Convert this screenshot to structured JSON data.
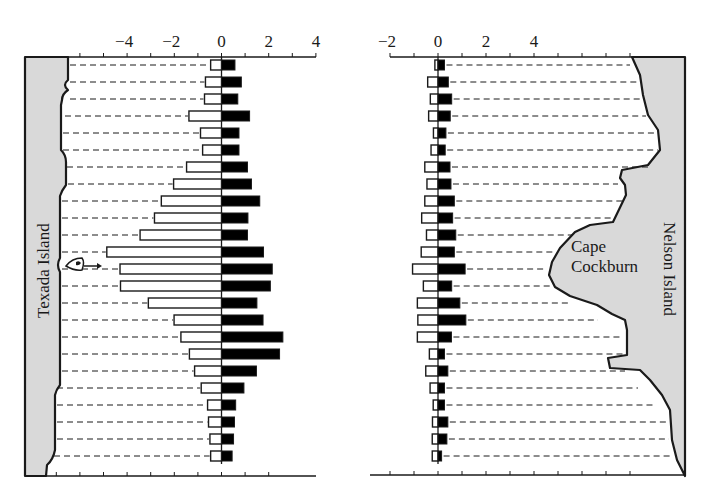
{
  "chart_data": [
    {
      "type": "bar",
      "orientation": "horizontal-diverging",
      "panel": "left",
      "title": "",
      "xlabel": "",
      "ylabel": "",
      "xlim": [
        -4.5,
        4
      ],
      "x_ticks": [
        -4,
        -2,
        0,
        2,
        4
      ],
      "x_tick_labels": [
        "−4",
        "−2",
        "0",
        "2",
        "4"
      ],
      "minor_tick_step": 1,
      "grid": "dashed transect lines from coast to bars",
      "island_label": "Texada Island",
      "marker_annotation": "boat-with-arrow",
      "marker_row": 13,
      "categories": [
        "1",
        "2",
        "3",
        "4",
        "5",
        "6",
        "7",
        "8",
        "9",
        "10",
        "11",
        "12",
        "13",
        "14",
        "15",
        "16",
        "17",
        "18",
        "19",
        "20",
        "21",
        "22",
        "23",
        "24"
      ],
      "series": [
        {
          "name": "open bars (negative)",
          "fill": "#ffffff",
          "values": [
            -0.46,
            -0.68,
            -0.72,
            -1.38,
            -0.89,
            -0.8,
            -1.48,
            -2.03,
            -2.55,
            -2.84,
            -3.45,
            -4.86,
            -4.3,
            -4.28,
            -3.1,
            -2.01,
            -1.72,
            -1.36,
            -1.14,
            -0.86,
            -0.59,
            -0.55,
            -0.49,
            -0.46
          ]
        },
        {
          "name": "filled bars (positive)",
          "fill": "#000000",
          "values": [
            0.57,
            0.84,
            0.69,
            1.19,
            0.74,
            0.74,
            1.1,
            1.27,
            1.62,
            1.12,
            1.1,
            1.78,
            2.15,
            2.07,
            1.5,
            1.76,
            2.6,
            2.46,
            1.48,
            0.95,
            0.6,
            0.55,
            0.51,
            0.45
          ]
        }
      ]
    },
    {
      "type": "bar",
      "orientation": "horizontal-diverging",
      "panel": "right",
      "title": "",
      "xlabel": "",
      "ylabel": "",
      "xlim": [
        -2,
        8
      ],
      "x_ticks": [
        -2,
        0,
        2,
        4
      ],
      "x_tick_labels": [
        "−2",
        "0",
        "2",
        "4"
      ],
      "minor_tick_step": 1,
      "grid": "dashed transect lines from bars to coast",
      "island_label": "Nelson Island",
      "feature_label": "Cape Cockburn",
      "categories": [
        "1",
        "2",
        "3",
        "4",
        "5",
        "6",
        "7",
        "8",
        "9",
        "10",
        "11",
        "12",
        "13",
        "14",
        "15",
        "16",
        "17",
        "18",
        "19",
        "20",
        "21",
        "22",
        "23",
        "24"
      ],
      "series": [
        {
          "name": "open bars (negative)",
          "fill": "#ffffff",
          "values": [
            -0.13,
            -0.43,
            -0.32,
            -0.39,
            -0.19,
            -0.29,
            -0.55,
            -0.46,
            -0.55,
            -0.68,
            -0.48,
            -0.7,
            -1.06,
            -0.61,
            -0.86,
            -0.84,
            -0.86,
            -0.36,
            -0.51,
            -0.33,
            -0.2,
            -0.23,
            -0.24,
            -0.24
          ]
        },
        {
          "name": "filled bars (positive)",
          "fill": "#000000",
          "values": [
            0.27,
            0.43,
            0.57,
            0.51,
            0.33,
            0.3,
            0.5,
            0.54,
            0.68,
            0.61,
            0.74,
            0.68,
            1.13,
            0.57,
            0.91,
            1.16,
            0.56,
            0.27,
            0.41,
            0.27,
            0.27,
            0.41,
            0.37,
            0.15
          ]
        }
      ]
    }
  ],
  "labels": {
    "left_island": "Texada Island",
    "right_island": "Nelson Island",
    "cape_line1": "Cape",
    "cape_line2": "Cockburn"
  },
  "colors": {
    "land": "#d9d9d9",
    "ink": "#1a1a1a",
    "open_bar": "#ffffff",
    "filled_bar": "#000000"
  }
}
